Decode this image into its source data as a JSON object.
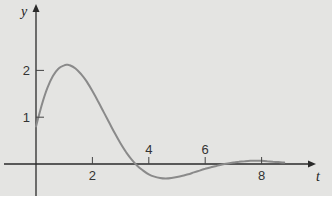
{
  "chart_data": {
    "type": "line",
    "title": "",
    "xlabel": "t",
    "ylabel": "y",
    "xlim": [
      -0.6,
      10
    ],
    "ylim": [
      -0.65,
      3.4
    ],
    "x_ticks": [
      2,
      4,
      6,
      8
    ],
    "y_ticks": [
      1,
      2
    ],
    "grid": false,
    "legend": null,
    "series": [
      {
        "name": "y(t)",
        "color": "#8a8a8a",
        "x": [
          0,
          0.2,
          0.4,
          0.6,
          0.8,
          1.0,
          1.1,
          1.2,
          1.4,
          1.6,
          1.8,
          2.0,
          2.2,
          2.4,
          2.6,
          2.8,
          3.0,
          3.2,
          3.4,
          3.6,
          3.8,
          4.0,
          4.2,
          4.4,
          4.6,
          4.8,
          5.0,
          5.2,
          5.4,
          5.6,
          5.8,
          6.0,
          6.2,
          6.4,
          6.6,
          6.8,
          7.0,
          7.2,
          7.4,
          7.6,
          7.8,
          8.0,
          8.2,
          8.4,
          8.6,
          8.8
        ],
        "y": [
          0.8,
          1.25,
          1.62,
          1.88,
          2.04,
          2.11,
          2.12,
          2.11,
          2.04,
          1.92,
          1.76,
          1.56,
          1.34,
          1.11,
          0.88,
          0.65,
          0.44,
          0.25,
          0.09,
          -0.04,
          -0.14,
          -0.22,
          -0.27,
          -0.3,
          -0.31,
          -0.3,
          -0.28,
          -0.25,
          -0.22,
          -0.18,
          -0.14,
          -0.1,
          -0.07,
          -0.04,
          -0.01,
          0.01,
          0.03,
          0.05,
          0.06,
          0.07,
          0.07,
          0.07,
          0.06,
          0.05,
          0.04,
          0.03
        ]
      }
    ]
  },
  "axes": {
    "x_label": "t",
    "y_label": "y",
    "x_tick_labels": [
      "2",
      "4",
      "6",
      "8"
    ],
    "y_tick_labels": [
      "1",
      "2"
    ]
  }
}
